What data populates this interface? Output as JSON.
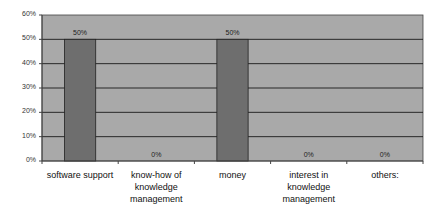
{
  "chart_data": {
    "type": "bar",
    "title": "",
    "xlabel": "",
    "ylabel": "",
    "categories": [
      "software support",
      "know-how of knowledge management",
      "money",
      "interest in knowledge management",
      "others:"
    ],
    "category_display": [
      "software support",
      "know-how of\nknowledge\nmanagement",
      "money",
      "interest in\nknowledge\nmanagement",
      "others:"
    ],
    "values": [
      50,
      0,
      50,
      0,
      0
    ],
    "data_labels": [
      "50%",
      "0%",
      "50%",
      "0%",
      "0%"
    ],
    "ylim": [
      0,
      60
    ],
    "yticks": [
      0,
      10,
      20,
      30,
      40,
      50,
      60
    ],
    "ytick_labels": [
      "0%",
      "10%",
      "20%",
      "30%",
      "40%",
      "50%",
      "60%"
    ],
    "grid": true,
    "legend": null,
    "colors": {
      "plot_background": "#a9a9a9",
      "bar": "#6e6e6e",
      "gridline": "#1a1a1a",
      "axis": "#444444"
    }
  }
}
